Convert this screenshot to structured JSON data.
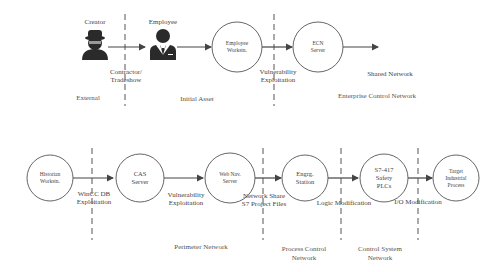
{
  "top_row": {
    "actors": [
      {
        "label": "Creator",
        "icon": "hacker-icon"
      },
      {
        "label": "Employee",
        "icon": "employee-icon"
      }
    ],
    "nodes": [
      {
        "label_line1": "Employee",
        "label_line2": "Workstn."
      },
      {
        "label_line1": "ECN",
        "label_line2": "Server"
      }
    ],
    "edge_labels": [
      {
        "line1": "Contractor/",
        "line2": "Tradeshow"
      },
      {
        "line1": "Vulnerability",
        "line2": "Exploitation"
      },
      {
        "line1": "Shared Network"
      }
    ],
    "zones": [
      "External",
      "Initial Asset",
      "Enterprise Control Network"
    ]
  },
  "bottom_row": {
    "nodes": [
      {
        "label_line1": "Historian",
        "label_line2": "Workstn."
      },
      {
        "label_line1": "CAS",
        "label_line2": "Server"
      },
      {
        "label_line1": "Web Nav.",
        "label_line2": "Server"
      },
      {
        "label_line1": "Engrg.",
        "label_line2": "Station"
      },
      {
        "label_line1": "S7-417",
        "label_line2": "Safety",
        "label_line3": "PLCs"
      },
      {
        "label_line1": "Target",
        "label_line2": "Industrial",
        "label_line3": "Process"
      }
    ],
    "edge_labels": [
      {
        "line1": "WinCC DB",
        "line2": "Exploitation"
      },
      {
        "line1": "Vulnerability",
        "line2": "Exploitation"
      },
      {
        "line1": "Network Share",
        "line2": "S7 Project Files"
      },
      {
        "line1": "Logic Modification"
      },
      {
        "line1": "I/O Modification"
      }
    ],
    "zones": [
      {
        "line1": "Perimeter Network"
      },
      {
        "line1": "Process Control",
        "line2": "Network"
      },
      {
        "line1": "Control System",
        "line2": "Network"
      }
    ]
  },
  "colors": {
    "stroke": "#555555",
    "icon": "#2a2a2a",
    "text": "#444444"
  }
}
